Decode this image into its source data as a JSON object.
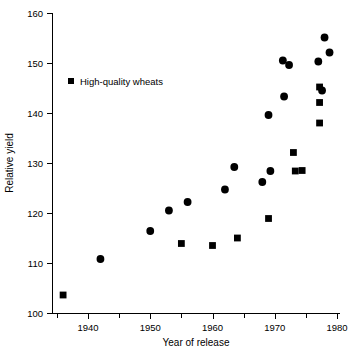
{
  "chart_data": {
    "type": "scatter",
    "title": "",
    "xlabel": "Year of release",
    "ylabel": "Relative yield",
    "xlim": [
      1935,
      1981
    ],
    "ylim": [
      100,
      160
    ],
    "xticks": [
      1940,
      1950,
      1960,
      1970,
      1980
    ],
    "xticklabels": [
      "1940",
      "1950",
      "1960",
      "1970",
      "1980"
    ],
    "xminorticks": [
      1935,
      1945,
      1955,
      1965,
      1975
    ],
    "yticks": [
      100,
      110,
      120,
      130,
      140,
      150,
      160
    ],
    "yticklabels": [
      "100",
      "110",
      "120",
      "130",
      "140",
      "150",
      "160"
    ],
    "grid": false,
    "legend_position": "upper-left-inside",
    "marker_color": "#000000",
    "series": [
      {
        "name": "Other wheats",
        "marker": "circle",
        "points": [
          {
            "x": 1942,
            "y": 110.8
          },
          {
            "x": 1950,
            "y": 116.4
          },
          {
            "x": 1953,
            "y": 120.5
          },
          {
            "x": 1956,
            "y": 122.2
          },
          {
            "x": 1962,
            "y": 124.7
          },
          {
            "x": 1963.5,
            "y": 129.2
          },
          {
            "x": 1968,
            "y": 126.2
          },
          {
            "x": 1969,
            "y": 139.6
          },
          {
            "x": 1969.3,
            "y": 128.4
          },
          {
            "x": 1971.3,
            "y": 150.5
          },
          {
            "x": 1971.5,
            "y": 143.3
          },
          {
            "x": 1972.3,
            "y": 149.6
          },
          {
            "x": 1977,
            "y": 150.3
          },
          {
            "x": 1977.6,
            "y": 144.5
          },
          {
            "x": 1978,
            "y": 155.1
          },
          {
            "x": 1978.8,
            "y": 152.1
          }
        ]
      },
      {
        "name": "High-quality wheats",
        "marker": "square",
        "points": [
          {
            "x": 1936,
            "y": 103.6
          },
          {
            "x": 1955,
            "y": 113.9
          },
          {
            "x": 1960,
            "y": 113.5
          },
          {
            "x": 1964,
            "y": 115.0
          },
          {
            "x": 1969,
            "y": 118.9
          },
          {
            "x": 1973,
            "y": 132.1
          },
          {
            "x": 1973.3,
            "y": 128.4
          },
          {
            "x": 1974.4,
            "y": 128.5
          },
          {
            "x": 1977.2,
            "y": 145.2
          },
          {
            "x": 1977.2,
            "y": 142.1
          },
          {
            "x": 1977.2,
            "y": 138.0
          }
        ]
      }
    ],
    "legend": [
      {
        "label": "High-quality wheats",
        "marker": "square",
        "color": "#000000"
      }
    ]
  }
}
